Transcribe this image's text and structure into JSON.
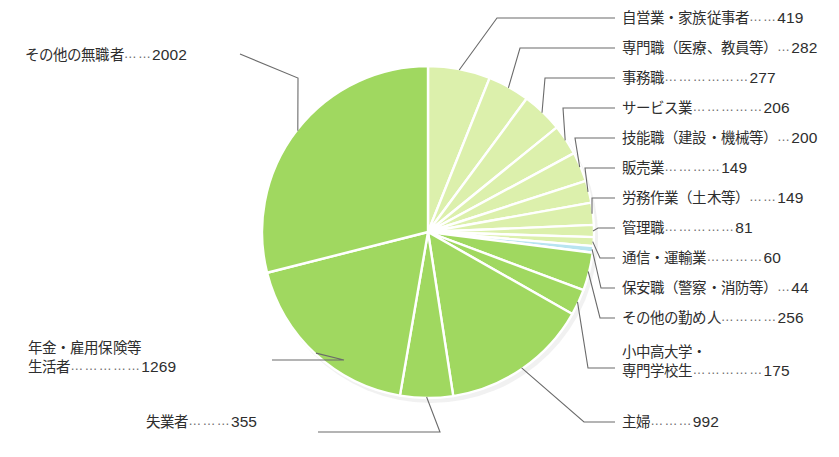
{
  "chart_data": {
    "type": "pie",
    "title": "",
    "total": 6916,
    "unit": "",
    "legend_position": "callout-labels",
    "colors": {
      "dark_green": "#a0d860",
      "pale_green": "#dcf0ac",
      "light_blue": "#b8e4f0",
      "leader_line": "#6b6b6b",
      "slice_gap": "#ffffff",
      "text": "#2e2e2e"
    },
    "start_angle_deg": -90,
    "direction": "clockwise",
    "categories": [
      "自営業・家族従事者",
      "専門職（医療、教員等）",
      "事務職",
      "サービス業",
      "技能職（建設・機械等）",
      "販売業",
      "労務作業（土木等）",
      "管理職",
      "通信・運輸業",
      "保安職（警察・消防等）",
      "その他の勤め人",
      "小中高大学・専門学校生",
      "主婦",
      "失業者",
      "年金・雇用保険等生活者",
      "その他の無職者"
    ],
    "values": [
      419,
      282,
      277,
      206,
      200,
      149,
      149,
      81,
      60,
      44,
      256,
      175,
      992,
      355,
      1269,
      2002
    ],
    "slice_colors": [
      "#dcf0ac",
      "#dcf0ac",
      "#dcf0ac",
      "#dcf0ac",
      "#dcf0ac",
      "#dcf0ac",
      "#dcf0ac",
      "#dcf0ac",
      "#dcf0ac",
      "#b8e4f0",
      "#a0d860",
      "#a0d860",
      "#a0d860",
      "#a0d860",
      "#a0d860",
      "#a0d860"
    ]
  },
  "labels": {
    "right": [
      {
        "name": "自営業・家族従事者",
        "dots": "……",
        "value": "419"
      },
      {
        "name": "専門職（医療、教員等）",
        "dots": "…",
        "value": "282"
      },
      {
        "name": "事務職",
        "dots": "………………",
        "value": "277"
      },
      {
        "name": "サービス業",
        "dots": "……………",
        "value": "206"
      },
      {
        "name": "技能職（建設・機械等）",
        "dots": "…",
        "value": "200"
      },
      {
        "name": "販売業",
        "dots": "…………",
        "value": "149"
      },
      {
        "name": "労務作業（土木等）",
        "dots": "……",
        "value": "149"
      },
      {
        "name": "管理職",
        "dots": "……………",
        "value": "81"
      },
      {
        "name": "通信・運輸業",
        "dots": "…………",
        "value": "60"
      },
      {
        "name": "保安職（警察・消防等）",
        "dots": "…",
        "value": "44"
      },
      {
        "name": "その他の勤め人",
        "dots": "…………",
        "value": "256"
      }
    ],
    "student": {
      "line1": "小中高大学・",
      "line2": "専門学校生",
      "dots": "……………",
      "value": "175"
    },
    "housewife": {
      "name": "主婦",
      "dots": "………",
      "value": "992"
    },
    "unemployed": {
      "name": "失業者",
      "dots": "………",
      "value": "355"
    },
    "pension": {
      "line1": "年金・雇用保険等",
      "line2": "生活者",
      "dots": "……………",
      "value": "1269"
    },
    "other_jobless": {
      "name": "その他の無職者",
      "dots": "……",
      "value": "2002"
    }
  }
}
